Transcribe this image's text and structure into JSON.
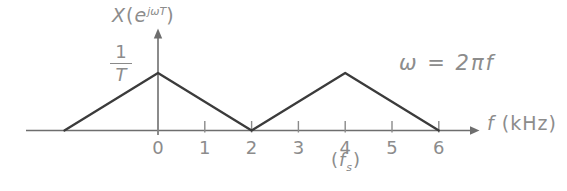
{
  "labels": {
    "y_axis": {
      "prefix": "X",
      "open_paren": "(",
      "base": "e",
      "superscript": "jωT",
      "close_paren": ")"
    },
    "peak_fraction": {
      "numerator": "1",
      "denominator": "T"
    },
    "equation": "ω = 2πf",
    "x_axis": {
      "symbol": "f",
      "unit": " (kHz)"
    },
    "sampling_frequency": {
      "open": "(",
      "base": "f",
      "subscript": "s",
      "close": ")"
    }
  },
  "colors": {
    "background": "#ffffff",
    "line": "#3b3b3b",
    "axis": "#6e6e6e",
    "tick": "#8a8a8a",
    "text": "#8c8c8c"
  },
  "chart_data": {
    "type": "line",
    "title": "",
    "xlabel": "f (kHz)",
    "ylabel": "X(e^{jωT})",
    "series": [
      {
        "name": "periodic triangular spectrum X(e^{jωT})",
        "x_kHz": [
          -2,
          0,
          2,
          4,
          6
        ],
        "y": [
          "0",
          "1/T",
          "0",
          "1/T",
          "0"
        ],
        "y_normalized": [
          0,
          1,
          0,
          1,
          0
        ]
      }
    ],
    "x_ticks": [
      0,
      1,
      2,
      3,
      4,
      5,
      6
    ],
    "xlim": [
      -2.9,
      6.9
    ],
    "ylim_normalized": [
      0,
      1.6
    ],
    "grid": false,
    "legend": false,
    "peak_value": "1/T",
    "annotations": [
      {
        "text": "ω = 2πf",
        "location": "upper-right"
      },
      {
        "text": "(fs)",
        "location": "below x-axis at f = 4 kHz"
      }
    ]
  }
}
